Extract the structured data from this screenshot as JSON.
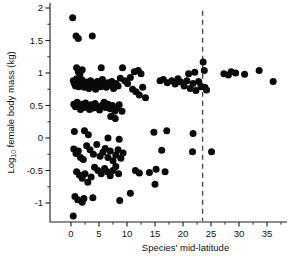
{
  "chart_data": {
    "type": "scatter",
    "title": "",
    "xlabel": "Species' mid-latitude",
    "ylabel_main": "Log",
    "ylabel_sub": "10",
    "ylabel_rest": " female body mass (kg)",
    "ylabel_full": "Log10 female body mass (kg)",
    "xlim": [
      -3,
      40
    ],
    "ylim": [
      -1.35,
      2.05
    ],
    "xticks": [
      0,
      5,
      10,
      15,
      20,
      25,
      30,
      35,
      40
    ],
    "xticklabels": [
      "0",
      "5",
      "10",
      "15",
      "20",
      "25",
      "30",
      "35",
      "40"
    ],
    "xminorticks": [
      2.5,
      7.5,
      12.5,
      17.5,
      22.5,
      27.5,
      32.5,
      37.5
    ],
    "yticks": [
      -1,
      -0.5,
      0,
      0.5,
      1,
      1.5,
      2
    ],
    "yticklabels": [
      "-1",
      "-0.5",
      "0",
      "0.5",
      "1",
      "1.5",
      "2"
    ],
    "yminorticks": [
      -0.75,
      -0.25,
      0.25,
      0.75,
      1.25,
      1.75
    ],
    "grid": false,
    "legend": false,
    "marker_color": "#0a0a0a",
    "marker_size_px": 7,
    "annotations": [
      {
        "name": "tropic-threshold",
        "type": "vline",
        "x": 23.5,
        "style": "dashed",
        "color": "#4a4a4a"
      }
    ],
    "points": [
      [
        0.3,
        1.85
      ],
      [
        0.9,
        1.57
      ],
      [
        1.3,
        1.53
      ],
      [
        3.8,
        1.57
      ],
      [
        1.0,
        1.08
      ],
      [
        1.3,
        1.02
      ],
      [
        1.6,
        0.99
      ],
      [
        2.0,
        1.05
      ],
      [
        5.4,
        1.08
      ],
      [
        9.2,
        1.08
      ],
      [
        11.3,
        1.02
      ],
      [
        12.0,
        1.04
      ],
      [
        12.5,
        0.99
      ],
      [
        10.6,
        0.93
      ],
      [
        21.0,
        0.99
      ],
      [
        22.1,
        1.01
      ],
      [
        23.6,
        1.17
      ],
      [
        23.8,
        1.04
      ],
      [
        27.3,
        0.99
      ],
      [
        28.1,
        0.97
      ],
      [
        28.6,
        1.02
      ],
      [
        29.4,
        1.0
      ],
      [
        31.0,
        0.98
      ],
      [
        33.6,
        1.04
      ],
      [
        36.1,
        0.87
      ],
      [
        0.4,
        0.88
      ],
      [
        0.6,
        0.84
      ],
      [
        0.8,
        0.8
      ],
      [
        1.0,
        0.91
      ],
      [
        1.2,
        0.86
      ],
      [
        1.4,
        0.79
      ],
      [
        1.6,
        0.83
      ],
      [
        1.9,
        0.9
      ],
      [
        2.1,
        0.82
      ],
      [
        2.4,
        0.78
      ],
      [
        2.7,
        0.86
      ],
      [
        2.9,
        0.81
      ],
      [
        3.2,
        0.76
      ],
      [
        3.5,
        0.88
      ],
      [
        3.8,
        0.8
      ],
      [
        4.1,
        0.84
      ],
      [
        4.4,
        0.75
      ],
      [
        4.7,
        0.87
      ],
      [
        5.0,
        0.82
      ],
      [
        5.3,
        0.79
      ],
      [
        5.6,
        0.9
      ],
      [
        5.9,
        0.83
      ],
      [
        6.3,
        0.78
      ],
      [
        6.6,
        0.85
      ],
      [
        6.9,
        0.81
      ],
      [
        7.3,
        0.87
      ],
      [
        7.6,
        0.76
      ],
      [
        8.0,
        0.84
      ],
      [
        8.4,
        0.8
      ],
      [
        8.8,
        0.92
      ],
      [
        9.6,
        0.88
      ],
      [
        10.1,
        0.84
      ],
      [
        11.0,
        0.75
      ],
      [
        11.6,
        0.71
      ],
      [
        12.2,
        0.66
      ],
      [
        12.8,
        0.78
      ],
      [
        13.3,
        0.62
      ],
      [
        15.9,
        0.88
      ],
      [
        16.5,
        0.9
      ],
      [
        17.2,
        0.85
      ],
      [
        18.0,
        0.88
      ],
      [
        18.6,
        0.83
      ],
      [
        19.1,
        0.91
      ],
      [
        19.6,
        0.86
      ],
      [
        20.2,
        0.8
      ],
      [
        20.7,
        0.88
      ],
      [
        21.3,
        0.76
      ],
      [
        21.8,
        0.84
      ],
      [
        22.3,
        0.73
      ],
      [
        22.8,
        0.87
      ],
      [
        23.2,
        0.79
      ],
      [
        23.9,
        0.78
      ],
      [
        24.2,
        0.74
      ],
      [
        0.5,
        0.52
      ],
      [
        0.8,
        0.48
      ],
      [
        1.1,
        0.55
      ],
      [
        1.4,
        0.5
      ],
      [
        1.7,
        0.44
      ],
      [
        2.0,
        0.52
      ],
      [
        2.3,
        0.47
      ],
      [
        2.6,
        0.54
      ],
      [
        2.9,
        0.49
      ],
      [
        3.3,
        0.44
      ],
      [
        3.6,
        0.51
      ],
      [
        4.0,
        0.46
      ],
      [
        4.3,
        0.53
      ],
      [
        4.7,
        0.48
      ],
      [
        5.1,
        0.43
      ],
      [
        5.5,
        0.5
      ],
      [
        5.9,
        0.55
      ],
      [
        6.2,
        0.47
      ],
      [
        6.6,
        0.52
      ],
      [
        7.0,
        0.45
      ],
      [
        7.4,
        0.5
      ],
      [
        7.8,
        0.41
      ],
      [
        8.2,
        0.46
      ],
      [
        8.6,
        0.51
      ],
      [
        7.1,
        0.33
      ],
      [
        7.9,
        0.3
      ],
      [
        9.1,
        0.41
      ],
      [
        0.6,
        0.1
      ],
      [
        2.4,
        0.11
      ],
      [
        3.1,
        0.05
      ],
      [
        6.6,
        0.0
      ],
      [
        8.6,
        -0.02
      ],
      [
        14.8,
        0.09
      ],
      [
        17.1,
        0.11
      ],
      [
        21.8,
        0.07
      ],
      [
        0.5,
        -0.17
      ],
      [
        0.9,
        -0.24
      ],
      [
        1.3,
        -0.2
      ],
      [
        1.7,
        -0.3
      ],
      [
        2.2,
        -0.33
      ],
      [
        2.8,
        -0.12
      ],
      [
        3.4,
        -0.18
      ],
      [
        4.0,
        -0.25
      ],
      [
        4.6,
        -0.1
      ],
      [
        5.2,
        -0.28
      ],
      [
        5.7,
        -0.22
      ],
      [
        6.1,
        -0.16
      ],
      [
        6.6,
        -0.3
      ],
      [
        7.0,
        -0.2
      ],
      [
        7.5,
        -0.35
      ],
      [
        8.0,
        -0.26
      ],
      [
        8.4,
        -0.18
      ],
      [
        8.9,
        -0.31
      ],
      [
        9.3,
        -0.23
      ],
      [
        16.2,
        -0.19
      ],
      [
        21.7,
        -0.21
      ],
      [
        25.1,
        -0.21
      ],
      [
        1.0,
        -0.52
      ],
      [
        1.5,
        -0.57
      ],
      [
        2.0,
        -0.62
      ],
      [
        2.5,
        -0.55
      ],
      [
        3.0,
        -0.68
      ],
      [
        3.6,
        -0.6
      ],
      [
        4.2,
        -0.45
      ],
      [
        4.8,
        -0.5
      ],
      [
        5.4,
        -0.55
      ],
      [
        6.0,
        -0.47
      ],
      [
        6.5,
        -0.52
      ],
      [
        7.0,
        -0.58
      ],
      [
        7.5,
        -0.5
      ],
      [
        8.0,
        -0.44
      ],
      [
        8.5,
        -0.55
      ],
      [
        11.5,
        -0.5
      ],
      [
        12.2,
        -0.54
      ],
      [
        14.0,
        -0.53
      ],
      [
        15.2,
        -0.48
      ],
      [
        16.8,
        -0.52
      ],
      [
        15.0,
        -0.71
      ],
      [
        0.7,
        -0.9
      ],
      [
        1.2,
        -0.95
      ],
      [
        2.0,
        -0.99
      ],
      [
        2.3,
        -0.93
      ],
      [
        3.9,
        -0.92
      ],
      [
        8.7,
        -0.96
      ],
      [
        10.6,
        -0.85
      ],
      [
        0.4,
        -1.2
      ]
    ]
  }
}
